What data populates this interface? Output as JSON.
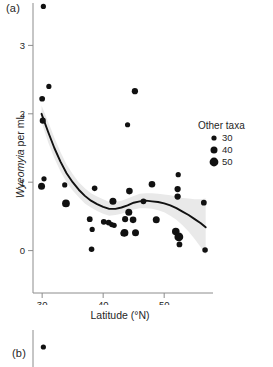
{
  "figure": {
    "panel_a_label": "(a)",
    "panel_b_label": "(b)",
    "background_color": "#ffffff",
    "point_color": "#111111",
    "line_color": "#111111",
    "band_color": "#e8e8e8",
    "axis_color": "#8c8c8c"
  },
  "legend": {
    "title": "Other taxa",
    "entries": [
      {
        "label": "30",
        "value": 30,
        "radius_px": 2.6
      },
      {
        "label": "40",
        "value": 40,
        "radius_px": 3.5
      },
      {
        "label": "50",
        "value": 50,
        "radius_px": 4.4
      }
    ]
  },
  "chart_data": {
    "type": "scatter",
    "title": "",
    "panel": "(a)",
    "xlabel": "Latitude (°N)",
    "ylabel": "Wyeomyia per mL",
    "xlim": [
      28.5,
      58.0
    ],
    "ylim": [
      -0.62,
      3.62
    ],
    "xticks": [
      30,
      40,
      50
    ],
    "xtick_labels": [
      "30",
      "40",
      "50"
    ],
    "yticks": [
      0,
      1,
      2,
      3
    ],
    "ytick_labels": [
      "0",
      "1",
      "2",
      "3"
    ],
    "grid": false,
    "legend_position": "right",
    "size_encoding": {
      "variable": "Other taxa",
      "legend_values": [
        30,
        40,
        50
      ]
    },
    "series": [
      {
        "name": "Wyeomyia per mL",
        "marker": "circle",
        "color": "#111111",
        "points": [
          {
            "x": 30.2,
            "y": 3.57,
            "size": 30
          },
          {
            "x": 31.1,
            "y": 2.4,
            "size": 30
          },
          {
            "x": 30.0,
            "y": 2.22,
            "size": 33
          },
          {
            "x": 30.1,
            "y": 1.9,
            "size": 35
          },
          {
            "x": 45.2,
            "y": 2.33,
            "size": 36
          },
          {
            "x": 44.0,
            "y": 1.84,
            "size": 30
          },
          {
            "x": 30.3,
            "y": 1.05,
            "size": 30
          },
          {
            "x": 29.9,
            "y": 0.94,
            "size": 40
          },
          {
            "x": 33.7,
            "y": 0.96,
            "size": 30
          },
          {
            "x": 33.9,
            "y": 0.69,
            "size": 44
          },
          {
            "x": 38.6,
            "y": 0.91,
            "size": 32
          },
          {
            "x": 37.8,
            "y": 0.46,
            "size": 33
          },
          {
            "x": 38.2,
            "y": 0.31,
            "size": 30
          },
          {
            "x": 38.1,
            "y": 0.02,
            "size": 32
          },
          {
            "x": 40.1,
            "y": 0.42,
            "size": 33
          },
          {
            "x": 40.9,
            "y": 0.41,
            "size": 33
          },
          {
            "x": 41.4,
            "y": 0.38,
            "size": 30
          },
          {
            "x": 41.8,
            "y": 0.37,
            "size": 30
          },
          {
            "x": 41.6,
            "y": 0.72,
            "size": 40
          },
          {
            "x": 43.5,
            "y": 0.26,
            "size": 44
          },
          {
            "x": 43.3,
            "y": 0.25,
            "size": 33
          },
          {
            "x": 43.6,
            "y": 0.46,
            "size": 35
          },
          {
            "x": 44.2,
            "y": 0.56,
            "size": 40
          },
          {
            "x": 44.3,
            "y": 0.87,
            "size": 38
          },
          {
            "x": 44.9,
            "y": 0.45,
            "size": 38
          },
          {
            "x": 45.3,
            "y": 0.26,
            "size": 40
          },
          {
            "x": 46.6,
            "y": 0.72,
            "size": 33
          },
          {
            "x": 48.0,
            "y": 0.97,
            "size": 38
          },
          {
            "x": 48.7,
            "y": 0.45,
            "size": 40
          },
          {
            "x": 52.3,
            "y": 1.11,
            "size": 30
          },
          {
            "x": 52.2,
            "y": 0.9,
            "size": 36
          },
          {
            "x": 52.2,
            "y": 0.79,
            "size": 36
          },
          {
            "x": 51.9,
            "y": 0.28,
            "size": 43
          },
          {
            "x": 52.4,
            "y": 0.2,
            "size": 50
          },
          {
            "x": 52.5,
            "y": 0.09,
            "size": 33
          },
          {
            "x": 56.5,
            "y": 0.7,
            "size": 33
          },
          {
            "x": 56.7,
            "y": 0.01,
            "size": 32
          }
        ]
      }
    ],
    "smoother": {
      "name": "loess-fit",
      "has_confidence_band": true,
      "band_label": "95% confidence band",
      "fit": [
        {
          "x": 29.9,
          "y": 2.0,
          "lo": 1.88,
          "hi": 2.12
        },
        {
          "x": 31.0,
          "y": 1.73,
          "lo": 1.58,
          "hi": 1.88
        },
        {
          "x": 32.0,
          "y": 1.5,
          "lo": 1.35,
          "hi": 1.65
        },
        {
          "x": 33.0,
          "y": 1.3,
          "lo": 1.16,
          "hi": 1.44
        },
        {
          "x": 34.0,
          "y": 1.13,
          "lo": 1.0,
          "hi": 1.26
        },
        {
          "x": 35.0,
          "y": 1.0,
          "lo": 0.88,
          "hi": 1.12
        },
        {
          "x": 36.0,
          "y": 0.89,
          "lo": 0.78,
          "hi": 1.0
        },
        {
          "x": 37.0,
          "y": 0.8,
          "lo": 0.69,
          "hi": 0.91
        },
        {
          "x": 38.0,
          "y": 0.73,
          "lo": 0.63,
          "hi": 0.84
        },
        {
          "x": 39.0,
          "y": 0.68,
          "lo": 0.58,
          "hi": 0.79
        },
        {
          "x": 40.0,
          "y": 0.64,
          "lo": 0.54,
          "hi": 0.75
        },
        {
          "x": 41.0,
          "y": 0.61,
          "lo": 0.51,
          "hi": 0.71
        },
        {
          "x": 42.0,
          "y": 0.61,
          "lo": 0.52,
          "hi": 0.71
        },
        {
          "x": 43.0,
          "y": 0.63,
          "lo": 0.54,
          "hi": 0.73
        },
        {
          "x": 44.0,
          "y": 0.66,
          "lo": 0.57,
          "hi": 0.76
        },
        {
          "x": 45.0,
          "y": 0.7,
          "lo": 0.6,
          "hi": 0.8
        },
        {
          "x": 46.0,
          "y": 0.72,
          "lo": 0.62,
          "hi": 0.83
        },
        {
          "x": 47.0,
          "y": 0.73,
          "lo": 0.62,
          "hi": 0.84
        },
        {
          "x": 48.0,
          "y": 0.72,
          "lo": 0.61,
          "hi": 0.84
        },
        {
          "x": 49.0,
          "y": 0.71,
          "lo": 0.59,
          "hi": 0.83
        },
        {
          "x": 50.0,
          "y": 0.69,
          "lo": 0.56,
          "hi": 0.82
        },
        {
          "x": 51.0,
          "y": 0.66,
          "lo": 0.51,
          "hi": 0.81
        },
        {
          "x": 52.0,
          "y": 0.62,
          "lo": 0.45,
          "hi": 0.79
        },
        {
          "x": 53.0,
          "y": 0.57,
          "lo": 0.37,
          "hi": 0.77
        },
        {
          "x": 54.0,
          "y": 0.52,
          "lo": 0.28,
          "hi": 0.76
        },
        {
          "x": 55.0,
          "y": 0.46,
          "lo": 0.17,
          "hi": 0.75
        },
        {
          "x": 56.0,
          "y": 0.4,
          "lo": 0.05,
          "hi": 0.75
        },
        {
          "x": 56.8,
          "y": 0.34,
          "lo": -0.06,
          "hi": 0.76
        }
      ]
    }
  },
  "panel_b": {
    "type": "scatter",
    "label": "(b)",
    "note": "panel cropped at image edge",
    "points": [
      {
        "x": 30.2,
        "y": 3.5,
        "size": 30
      }
    ]
  }
}
